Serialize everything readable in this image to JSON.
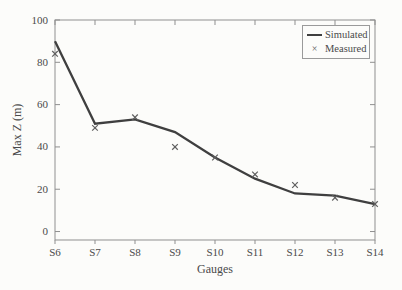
{
  "chart_data": {
    "type": "line",
    "title": "",
    "xlabel": "Gauges",
    "ylabel": "Max Z (m)",
    "categories": [
      "S6",
      "S7",
      "S8",
      "S9",
      "S10",
      "S11",
      "S12",
      "S13",
      "S14"
    ],
    "series": [
      {
        "name": "Simulated",
        "type": "line",
        "values": [
          90,
          51,
          53,
          47,
          35,
          25,
          18,
          17,
          13
        ]
      },
      {
        "name": "Measured",
        "type": "scatter",
        "marker": "x",
        "glyph": "×",
        "values": [
          84,
          49,
          54,
          40,
          35,
          27,
          22,
          16,
          13
        ]
      }
    ],
    "yticks": [
      0,
      20,
      40,
      60,
      80,
      100
    ],
    "ylim": [
      -4,
      100
    ],
    "grid": false,
    "legend_position": "top-right"
  },
  "colors": {
    "simulated_line": "#3f3f3f",
    "measured_marker": "#5f5f5f",
    "axis": "#8f8f8f",
    "text": "#4a4a4a",
    "legend_border": "#9a9a9a",
    "background": "#fcfcfa"
  }
}
